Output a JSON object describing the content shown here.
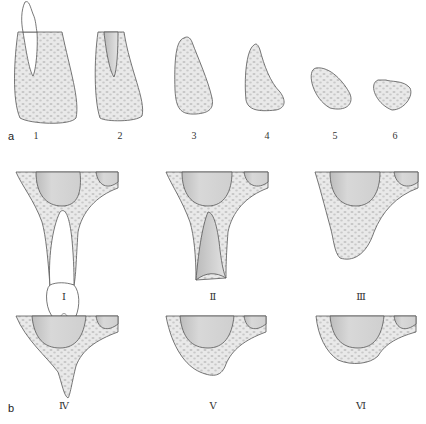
{
  "figure": {
    "colors": {
      "bone_fill": "#e9e9e9",
      "bone_outline": "#555555",
      "trabecular_dots": "#c2c2c2",
      "sinus_fill": "#cfcfcf",
      "sinus_shade": "#b9b9b9",
      "tooth_fill": "#ffffff",
      "socket_fill": "#d6d6d6"
    },
    "panel_a": {
      "label": "a",
      "stages": [
        {
          "label": "1",
          "description": "tooth in alveolus"
        },
        {
          "label": "2",
          "description": "empty extraction socket"
        },
        {
          "label": "3",
          "description": "tall narrow ridge"
        },
        {
          "label": "4",
          "description": "knife-edge ridge"
        },
        {
          "label": "5",
          "description": "low rounded ridge"
        },
        {
          "label": "6",
          "description": "flat depressed ridge"
        }
      ]
    },
    "panel_b": {
      "label": "b",
      "stages": [
        {
          "label": "Ⅰ",
          "description": "dentate with tooth"
        },
        {
          "label": "Ⅱ",
          "description": "post-extraction socket"
        },
        {
          "label": "Ⅲ",
          "description": "high rounded ridge"
        },
        {
          "label": "Ⅳ",
          "description": "knife-edge ridge"
        },
        {
          "label": "Ⅴ",
          "description": "low flat ridge"
        },
        {
          "label": "Ⅵ",
          "description": "depressed ridge"
        }
      ]
    }
  }
}
